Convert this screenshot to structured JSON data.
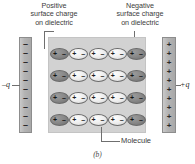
{
  "figure": {
    "panel_letter": "(b)",
    "title_hidden": "",
    "annotations": {
      "positive_surface_charge": "Positive\nsurface charge\non dielectric",
      "negative_surface_charge": "Negative\nsurface charge\non dielectric",
      "molecule": "Molecule"
    },
    "plates": {
      "left": {
        "charge_label": "–q",
        "symbol": "–",
        "count": 10,
        "color": "#b4b4b4"
      },
      "right": {
        "charge_label": "+q",
        "symbol": "+",
        "count": 10,
        "color": "#b4b4b4"
      }
    },
    "dielectric": {
      "color": "#d2d2d2",
      "rows": 4,
      "molecules_per_row": 5,
      "molecule": {
        "left_pole": "+",
        "right_pole": "–",
        "edge_fill": "#8a8a8a",
        "inner_fill": "#f0f0f0"
      }
    },
    "colors": {
      "background": "#ffffff",
      "text": "#3b3b3b",
      "leader_line": "#6f6f6f",
      "slab": "#d2d2d2",
      "plate": "#b4b4b4"
    }
  }
}
